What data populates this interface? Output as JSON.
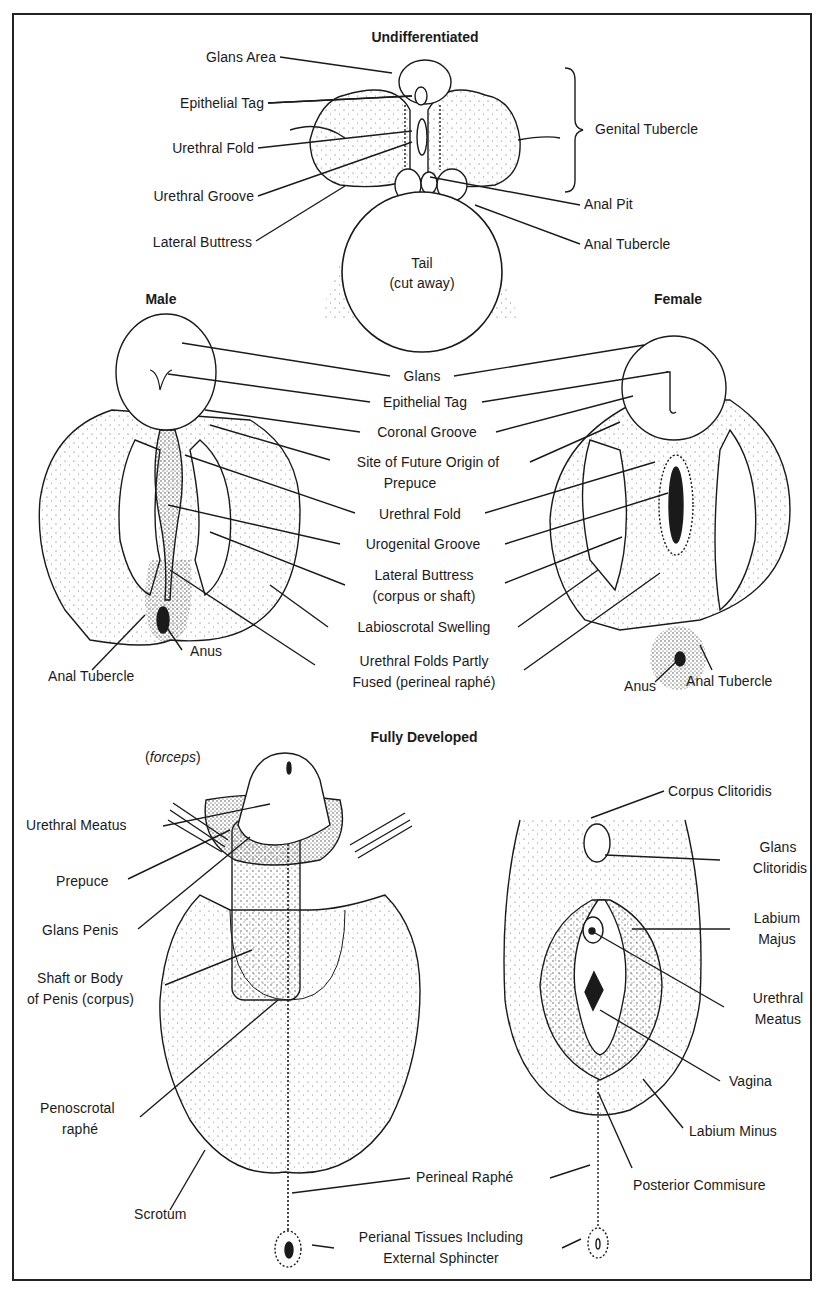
{
  "figure": {
    "sections": {
      "undifferentiated": {
        "title": "Undifferentiated",
        "labels": {
          "glans_area": "Glans Area",
          "epithelial_tag": "Epithelial Tag",
          "urethral_fold": "Urethral Fold",
          "urethral_groove": "Urethral Groove",
          "lateral_buttress": "Lateral Buttress",
          "genital_tubercle": "Genital Tubercle",
          "anal_pit": "Anal Pit",
          "anal_tubercle": "Anal Tubercle",
          "tail_line1": "Tail",
          "tail_line2": "(cut away)"
        }
      },
      "intermediate": {
        "male_title": "Male",
        "female_title": "Female",
        "shared_labels": {
          "glans": "Glans",
          "epithelial_tag": "Epithelial Tag",
          "coronal_groove": "Coronal Groove",
          "prepuce_site_line1": "Site of Future Origin of",
          "prepuce_site_line2": "Prepuce",
          "urethral_fold": "Urethral Fold",
          "urogenital_groove": "Urogenital Groove",
          "lateral_buttress_line1": "Lateral Buttress",
          "lateral_buttress_line2": "(corpus or shaft)",
          "labioscrotal_swelling": "Labioscrotal Swelling",
          "urethral_folds_line1": "Urethral Folds Partly",
          "urethral_folds_line2": "Fused (perineal raphé)"
        },
        "male_labels": {
          "anus": "Anus",
          "anal_tubercle": "Anal Tubercle"
        },
        "female_labels": {
          "anus": "Anus",
          "anal_tubercle": "Anal Tubercle"
        }
      },
      "fully_developed": {
        "title": "Fully Developed",
        "forceps_open": "(",
        "forceps": "forceps",
        "forceps_close": ")",
        "male_labels": {
          "urethral_meatus": "Urethral Meatus",
          "prepuce": "Prepuce",
          "glans_penis": "Glans Penis",
          "shaft_line1": "Shaft or Body",
          "shaft_line2": "of Penis (corpus)",
          "penoscrotal_line1": "Penoscrotal",
          "penoscrotal_line2": "raphé",
          "scrotum": "Scrotum"
        },
        "female_labels": {
          "corpus_clitoridis": "Corpus Clitoridis",
          "glans_clitoridis_line1": "Glans",
          "glans_clitoridis_line2": "Clitoridis",
          "labium_majus_line1": "Labium",
          "labium_majus_line2": "Majus",
          "urethral_meatus_line1": "Urethral",
          "urethral_meatus_line2": "Meatus",
          "vagina": "Vagina",
          "labium_minus": "Labium Minus",
          "posterior_commisure": "Posterior Commisure"
        },
        "shared_labels": {
          "perineal_raphe": "Perineal Raphé",
          "perianal_line1": "Perianal Tissues Including",
          "perianal_line2": "External Sphincter"
        }
      }
    },
    "colors": {
      "ink": "#1a1a1a",
      "paper": "#ffffff",
      "stipple": "#555555"
    }
  }
}
